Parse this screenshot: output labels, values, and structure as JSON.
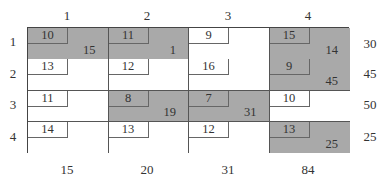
{
  "table": {
    "columns": [
      "1",
      "2",
      "3",
      "4"
    ],
    "rows": [
      "1",
      "2",
      "3",
      "4"
    ],
    "supply": [
      "30",
      "45",
      "50",
      "25"
    ],
    "demand": [
      "15",
      "20",
      "31",
      "84"
    ],
    "cells": [
      [
        {
          "cost": "10",
          "alloc": "15",
          "basic": true
        },
        {
          "cost": "11",
          "alloc": "1",
          "basic": true
        },
        {
          "cost": "9",
          "alloc": "",
          "basic": false
        },
        {
          "cost": "15",
          "alloc": "14",
          "basic": true
        }
      ],
      [
        {
          "cost": "13",
          "alloc": "",
          "basic": false
        },
        {
          "cost": "12",
          "alloc": "",
          "basic": false
        },
        {
          "cost": "16",
          "alloc": "",
          "basic": false
        },
        {
          "cost": "9",
          "alloc": "45",
          "basic": true
        }
      ],
      [
        {
          "cost": "11",
          "alloc": "",
          "basic": false
        },
        {
          "cost": "8",
          "alloc": "19",
          "basic": true
        },
        {
          "cost": "7",
          "alloc": "31",
          "basic": true
        },
        {
          "cost": "10",
          "alloc": "",
          "basic": false
        }
      ],
      [
        {
          "cost": "14",
          "alloc": "",
          "basic": false
        },
        {
          "cost": "13",
          "alloc": "",
          "basic": false
        },
        {
          "cost": "12",
          "alloc": "",
          "basic": false
        },
        {
          "cost": "13",
          "alloc": "25",
          "basic": true
        }
      ]
    ],
    "colors": {
      "basic_fill": "#a9a9a9",
      "empty_fill": "#ffffff",
      "line": "#444444"
    }
  }
}
